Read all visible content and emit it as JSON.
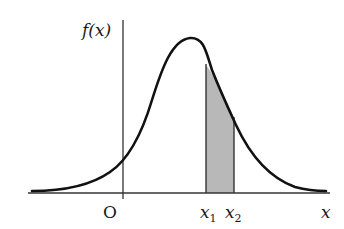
{
  "diagram": {
    "type": "probability-density-curve",
    "labels": {
      "y_axis": "f(x)",
      "x_axis": "x",
      "origin": "O",
      "x1_main": "x",
      "x1_sub": "1",
      "x2_main": "x",
      "x2_sub": "2"
    },
    "colors": {
      "curve": "#111111",
      "axis": "#333333",
      "shade": "#b8b8b8"
    }
  }
}
